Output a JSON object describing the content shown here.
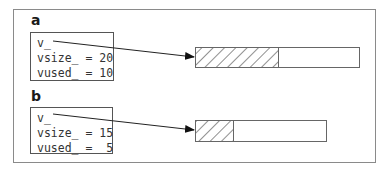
{
  "panels": [
    {
      "label": "a",
      "fields": {
        "pointer": "v_",
        "vsize": "vsize_ = 20",
        "vused": "vused_ = 10"
      },
      "vsize": 20,
      "vused": 10
    },
    {
      "label": "b",
      "fields": {
        "pointer": "v_",
        "vsize": "vsize_ = 15",
        "vused": "vused_ =  5"
      },
      "vsize": 15,
      "vused": 5
    }
  ]
}
